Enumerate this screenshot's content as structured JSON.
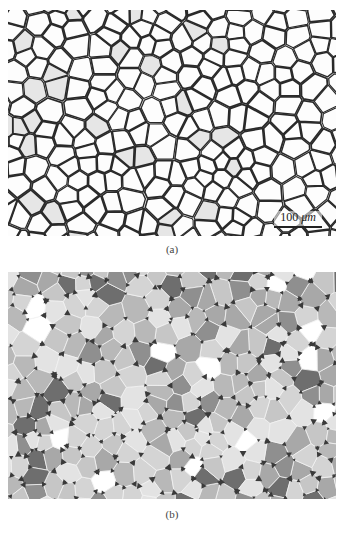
{
  "figure": {
    "panels": [
      {
        "id": "a",
        "caption": "(a)",
        "type": "micrograph",
        "description": "optical micrograph of polygonal grains with dark boundaries",
        "scale_bar": {
          "value": "100",
          "unit": "μm"
        },
        "colors": {
          "background": "#fbfbfb",
          "boundary": "#2a2a2a",
          "grain_tint": "#e6e6e6"
        }
      },
      {
        "id": "b",
        "caption": "(b)",
        "type": "segmented-grain-map",
        "description": "grayscale-labeled grain map with triple-junction pores",
        "colors": {
          "boundary": "#f2f2f2",
          "pore": "#3a3a3a",
          "gray_levels": [
            "#ffffff",
            "#e3e3e3",
            "#d4d4d4",
            "#c6c6c6",
            "#b8b8b8",
            "#a8a8a8",
            "#8f8f8f",
            "#6e6e6e"
          ]
        }
      }
    ]
  }
}
